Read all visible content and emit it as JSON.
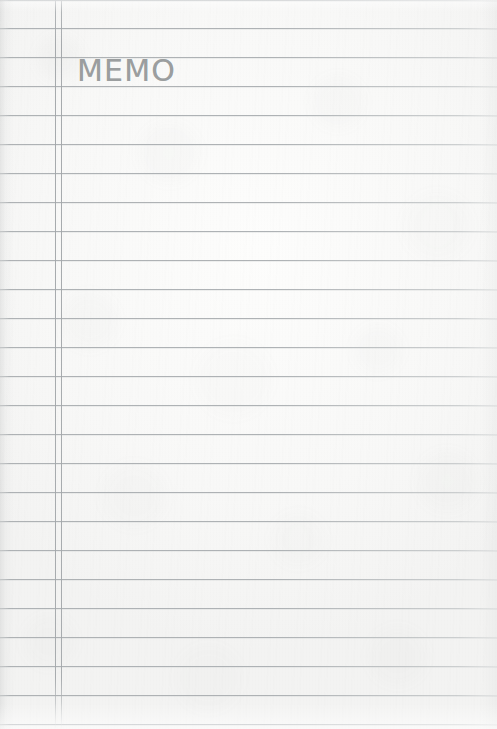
{
  "page": {
    "kind": "ruled-memo-notepad-scan",
    "title": "MEMO",
    "width_px": 497,
    "height_px": 729,
    "paper_color": "#fbfbfa",
    "rule_color": "#aaaeb1",
    "margin_line_color": "#a2a6a9",
    "heading_color": "#9b9e9f"
  },
  "heading": {
    "label": "MEMO",
    "left_px": 77,
    "top_px": 55,
    "font_size_px": 30,
    "letter_spacing_px": 1.2,
    "color": "#9b9e9f"
  },
  "ruling": {
    "line_count": 25,
    "first_line_y_px": 28,
    "line_spacing_px": 29,
    "line_thickness_px": 1,
    "color": "#aaaeb1",
    "rule_y_positions": [
      0,
      28,
      57,
      86,
      115,
      144,
      173,
      202,
      231,
      260,
      289,
      318,
      347,
      376,
      405,
      434,
      463,
      492,
      521,
      550,
      579,
      608,
      637,
      666,
      695,
      724
    ]
  },
  "margin_rules": {
    "count": 2,
    "color": "#a2a6a9",
    "thickness_px": 1,
    "x_positions_px": [
      55,
      61
    ]
  },
  "writing_area": {
    "label": "Blank ruled writing area",
    "left_px": 62,
    "top_px": 0,
    "content": ""
  },
  "notes_left_column": {
    "label": "Narrow left margin column",
    "left_px": 0,
    "width_px": 55,
    "content": ""
  }
}
